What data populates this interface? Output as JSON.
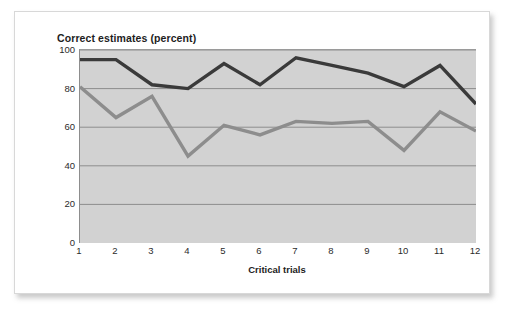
{
  "figure": {
    "title": "Correct estimates (percent)",
    "x_axis_title": "Critical trials",
    "background_color": "#ffffff",
    "plot_background_color": "#d2d2d2",
    "gridline_color": "#8d8d8d"
  },
  "chart_data": {
    "type": "line",
    "title": "Correct estimates (percent)",
    "xlabel": "Critical trials",
    "ylabel": "Correct estimates (percent)",
    "x": [
      1,
      2,
      3,
      4,
      5,
      6,
      7,
      8,
      9,
      10,
      11,
      12
    ],
    "categories": [
      "1",
      "2",
      "3",
      "4",
      "5",
      "6",
      "7",
      "8",
      "9",
      "10",
      "11",
      "12"
    ],
    "xlim": [
      1,
      12
    ],
    "ylim": [
      0,
      100
    ],
    "yticks": [
      0,
      20,
      40,
      60,
      80,
      100
    ],
    "ytick_labels": [
      "0",
      "20",
      "40",
      "60",
      "80",
      "100"
    ],
    "grid": true,
    "grid_axis": "y",
    "legend": false,
    "series": [
      {
        "name": "dark-line",
        "color": "#3a3a3a",
        "line_width": 3.4,
        "values": [
          95,
          95,
          82,
          80,
          93,
          82,
          96,
          92,
          88,
          81,
          92,
          72
        ]
      },
      {
        "name": "gray-line",
        "color": "#8d8d8d",
        "line_width": 3.4,
        "values": [
          81,
          65,
          76,
          45,
          61,
          56,
          63,
          62,
          63,
          48,
          68,
          58
        ]
      }
    ]
  }
}
